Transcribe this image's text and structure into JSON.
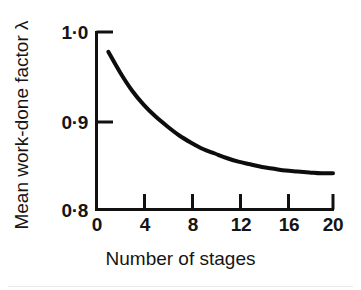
{
  "chart_data": {
    "type": "line",
    "title": "",
    "xlabel": "Number of stages",
    "ylabel": "Mean work-done factor λ",
    "xlim": [
      0,
      20
    ],
    "ylim": [
      0.8,
      1.0
    ],
    "grid": false,
    "legend": null,
    "xticks": [
      "0",
      "4",
      "8",
      "12",
      "16",
      "20"
    ],
    "xtick_values": [
      0,
      4,
      8,
      12,
      16,
      20
    ],
    "yticks": [
      "0·8",
      "0·9",
      "1·0"
    ],
    "ytick_values": [
      0.8,
      0.9,
      1.0
    ],
    "series": [
      {
        "name": "Mean work-done factor",
        "x": [
          1,
          2,
          3,
          4,
          5,
          6,
          7,
          8,
          9,
          10,
          11,
          12,
          13,
          14,
          15,
          16,
          17,
          18,
          19,
          20
        ],
        "values": [
          0.978,
          0.955,
          0.935,
          0.919,
          0.906,
          0.895,
          0.885,
          0.877,
          0.87,
          0.865,
          0.86,
          0.856,
          0.853,
          0.85,
          0.848,
          0.846,
          0.845,
          0.844,
          0.843,
          0.843
        ]
      }
    ],
    "line_color": "#0d0d0d",
    "line_width": 4,
    "axis_color": "#111111",
    "background": "#ffffff"
  },
  "axes": {
    "x_title": "Number of stages",
    "y_title": "Mean work-done factor λ",
    "x_tick_labels": [
      "0",
      "4",
      "8",
      "12",
      "16",
      "20"
    ],
    "y_tick_labels": [
      "0·8",
      "0·9",
      "1·0"
    ]
  }
}
